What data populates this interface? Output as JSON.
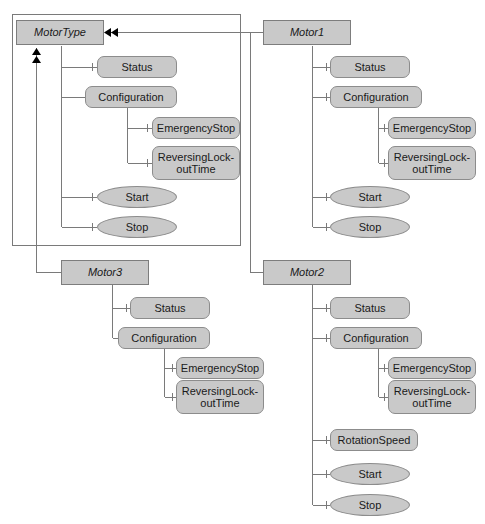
{
  "diagram": {
    "style": {
      "node_fill": "#c9c9c9",
      "node_border": "#8c8c8c",
      "line_color": "#7a7a7a",
      "arrow_color": "#000000",
      "background": "#ffffff"
    },
    "labels": {
      "motor_type": "MotorType",
      "motor1": "Motor1",
      "motor2": "Motor2",
      "motor3": "Motor3",
      "status": "Status",
      "configuration": "Configuration",
      "emergency_stop": "EmergencyStop",
      "reversing_lockout_time": "ReversingLock-\noutTime",
      "rotation_speed": "RotationSpeed",
      "start": "Start",
      "stop": "Stop"
    },
    "groups": [
      {
        "name": "motor-type-group",
        "root": "MotorType",
        "kind": "classifier",
        "members": [
          {
            "label": "Status",
            "kind": "attribute"
          },
          {
            "label": "Configuration",
            "kind": "attribute"
          },
          {
            "label": "EmergencyStop",
            "kind": "attribute",
            "parent": "Configuration"
          },
          {
            "label": "ReversingLock-\noutTime",
            "kind": "attribute",
            "parent": "Configuration"
          },
          {
            "label": "Start",
            "kind": "operation"
          },
          {
            "label": "Stop",
            "kind": "operation"
          }
        ]
      },
      {
        "name": "motor1-group",
        "root": "Motor1",
        "kind": "classifier",
        "members": [
          {
            "label": "Status",
            "kind": "attribute"
          },
          {
            "label": "Configuration",
            "kind": "attribute"
          },
          {
            "label": "EmergencyStop",
            "kind": "attribute",
            "parent": "Configuration"
          },
          {
            "label": "ReversingLock-\noutTime",
            "kind": "attribute",
            "parent": "Configuration"
          },
          {
            "label": "Start",
            "kind": "operation"
          },
          {
            "label": "Stop",
            "kind": "operation"
          }
        ]
      },
      {
        "name": "motor3-group",
        "root": "Motor3",
        "kind": "classifier",
        "members": [
          {
            "label": "Status",
            "kind": "attribute"
          },
          {
            "label": "Configuration",
            "kind": "attribute"
          },
          {
            "label": "EmergencyStop",
            "kind": "attribute",
            "parent": "Configuration"
          },
          {
            "label": "ReversingLock-\noutTime",
            "kind": "attribute",
            "parent": "Configuration"
          }
        ]
      },
      {
        "name": "motor2-group",
        "root": "Motor2",
        "kind": "classifier",
        "members": [
          {
            "label": "Status",
            "kind": "attribute"
          },
          {
            "label": "Configuration",
            "kind": "attribute"
          },
          {
            "label": "EmergencyStop",
            "kind": "attribute",
            "parent": "Configuration"
          },
          {
            "label": "ReversingLock-\noutTime",
            "kind": "attribute",
            "parent": "Configuration"
          },
          {
            "label": "RotationSpeed",
            "kind": "attribute"
          },
          {
            "label": "Start",
            "kind": "operation"
          },
          {
            "label": "Stop",
            "kind": "operation"
          }
        ]
      }
    ],
    "relations": [
      {
        "from": "Motor1",
        "to": "MotorType",
        "type": "instance-of",
        "arrow": "double"
      },
      {
        "from": "Motor2",
        "to": "MotorType",
        "type": "instance-of",
        "arrow": "double"
      },
      {
        "from": "Motor3",
        "to": "MotorType",
        "type": "instance-of",
        "arrow": "double"
      }
    ]
  }
}
